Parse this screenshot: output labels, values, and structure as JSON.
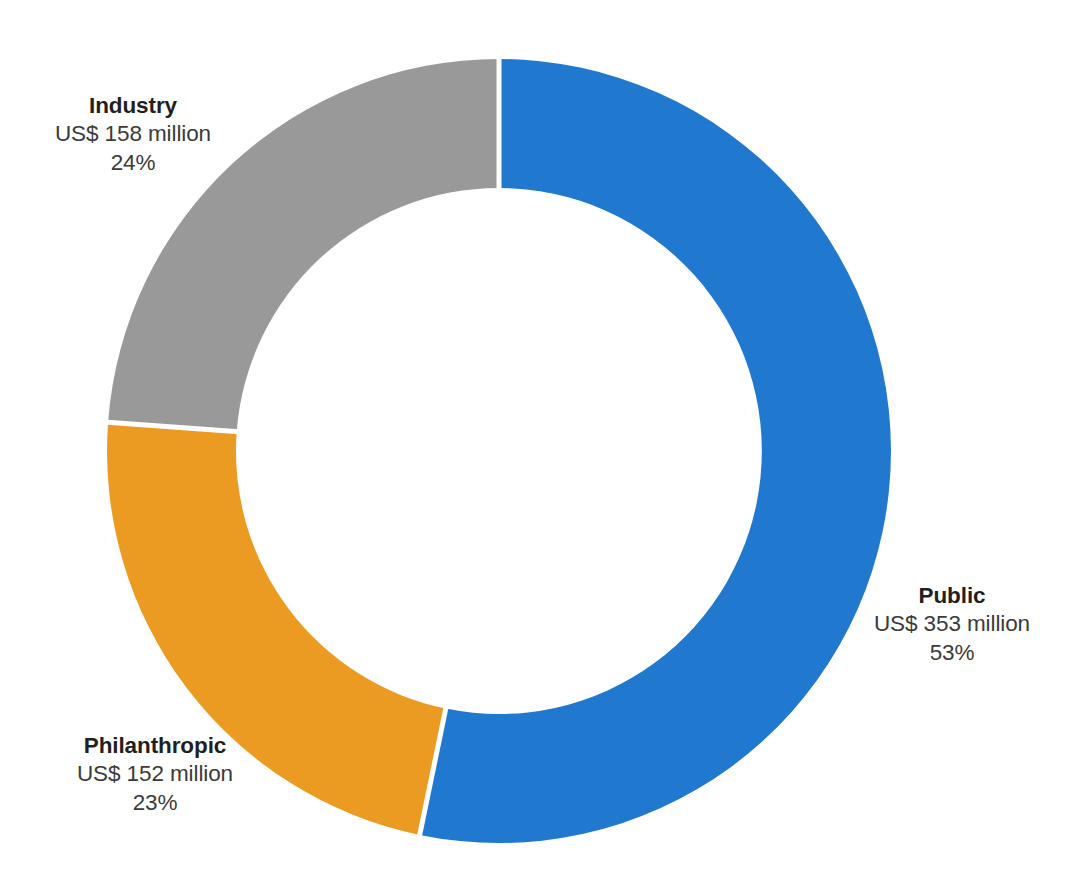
{
  "chart_data": {
    "type": "pie",
    "variant": "donut",
    "title": "",
    "subtitle": "",
    "xlabel": "",
    "ylabel": "",
    "grid": false,
    "legend_position": "callout-labels",
    "units": "US$ million",
    "total_value": 663,
    "total_label": "US$ 663 million",
    "start_angle_deg": 0,
    "direction": "clockwise",
    "categories": [
      "Public",
      "Philanthropic",
      "Industry"
    ],
    "values": [
      353,
      152,
      158
    ],
    "percentages": [
      53,
      23,
      24
    ],
    "colors": [
      "#2079ce",
      "#ec9b22",
      "#999999"
    ],
    "slices": [
      {
        "name": "Public",
        "value": 353,
        "value_text": "US$ 353 million",
        "percent": 53,
        "percent_text": "53%",
        "color": "#2079ce",
        "start_deg": 0,
        "end_deg": 190.8
      },
      {
        "name": "Philanthropic",
        "value": 152,
        "value_text": "US$ 152 million",
        "percent": 23,
        "percent_text": "23%",
        "color": "#ec9b22",
        "start_deg": 190.8,
        "end_deg": 273.6
      },
      {
        "name": "Industry",
        "value": 158,
        "value_text": "US$ 158 million",
        "percent": 24,
        "percent_text": "24%",
        "color": "#999999",
        "start_deg": 273.6,
        "end_deg": 360
      }
    ]
  },
  "labels": {
    "industry": {
      "title": "Industry",
      "value": "US$ 158 million",
      "percent": "24%"
    },
    "public": {
      "title": "Public",
      "value": "US$ 353 million",
      "percent": "53%"
    },
    "philanthropic": {
      "title": "Philanthropic",
      "value": "US$ 152 million",
      "percent": "23%"
    }
  },
  "style": {
    "background": "#ffffff",
    "separator_color": "#ffffff",
    "title_color": "#231f20",
    "text_color": "#3b3b3b"
  }
}
